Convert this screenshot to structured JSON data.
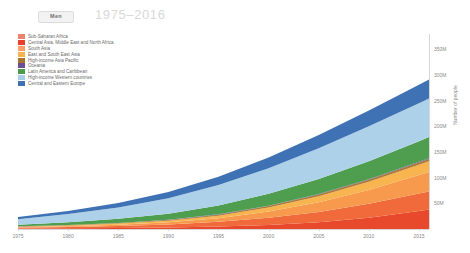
{
  "header": {
    "toggle_label": "Men",
    "title": "1975–2016"
  },
  "axes": {
    "y_title": "Number of people",
    "y_ticks": [
      "50M",
      "100M",
      "150M",
      "200M",
      "250M",
      "300M",
      "350M"
    ],
    "x_ticks": [
      "1975",
      "1980",
      "1985",
      "1990",
      "1995",
      "2000",
      "2005",
      "2010",
      "2015"
    ]
  },
  "legend": {
    "items": [
      {
        "label": "Sub-Saharan Africa",
        "color": "#f0826a"
      },
      {
        "label": "Central Asia, Middle East and North Africa",
        "color": "#e8402a"
      },
      {
        "label": "South Asia",
        "color": "#f9a06a"
      },
      {
        "label": "East and South East Asia",
        "color": "#f6b352"
      },
      {
        "label": "High-income Asia Pacific",
        "color": "#a9732e"
      },
      {
        "label": "Oceania",
        "color": "#6a4f93"
      },
      {
        "label": "Latin America and Caribbean",
        "color": "#4c9a4c"
      },
      {
        "label": "High-income Western countries",
        "color": "#a9cde8"
      },
      {
        "label": "Central and Eastern Europe",
        "color": "#3f72b5"
      }
    ]
  },
  "chart_data": {
    "type": "area",
    "stacked": true,
    "title": "1975–2016",
    "xlabel": "",
    "ylabel": "Number of people",
    "xlim": [
      1975,
      2016
    ],
    "ylim": [
      0,
      380
    ],
    "y_unit": "millions",
    "grid": false,
    "legend_position": "top-left",
    "x": [
      1975,
      1980,
      1985,
      1990,
      1995,
      2000,
      2005,
      2010,
      2015,
      2016
    ],
    "series": [
      {
        "name": "Sub-Saharan Africa",
        "color": "#e8492c",
        "values": [
          1,
          1.5,
          2,
          3,
          5,
          8,
          13,
          22,
          35,
          38
        ]
      },
      {
        "name": "Central Asia, Middle East and North Africa",
        "color": "#f06a3c",
        "values": [
          1.5,
          2.5,
          4,
          6,
          9,
          14,
          20,
          27,
          34,
          35
        ]
      },
      {
        "name": "South Asia",
        "color": "#f79a4e",
        "values": [
          1,
          1.5,
          2.5,
          4,
          7,
          12,
          19,
          27,
          36,
          38
        ]
      },
      {
        "name": "East and South East Asia",
        "color": "#f8b44f",
        "values": [
          1,
          1.5,
          2,
          3,
          5,
          8,
          12,
          16,
          20,
          21
        ]
      },
      {
        "name": "High-income Asia Pacific",
        "color": "#b07a33",
        "values": [
          0.5,
          0.7,
          1,
          1.4,
          2,
          2.6,
          3.2,
          3.8,
          4.4,
          4.5
        ]
      },
      {
        "name": "Oceania",
        "color": "#6a4f93",
        "values": [
          0.2,
          0.3,
          0.4,
          0.5,
          0.7,
          0.9,
          1.1,
          1.3,
          1.5,
          1.6
        ]
      },
      {
        "name": "Latin America and Caribbean",
        "color": "#4f9e4f",
        "values": [
          3,
          5,
          8,
          12,
          17,
          23,
          29,
          35,
          40,
          41
        ]
      },
      {
        "name": "High-income Western countries",
        "color": "#aed1ea",
        "values": [
          11,
          16,
          22,
          30,
          40,
          50,
          60,
          68,
          74,
          75
        ]
      },
      {
        "name": "Central and Eastern Europe",
        "color": "#3f72b5",
        "values": [
          4,
          6,
          9,
          12,
          16,
          21,
          26,
          31,
          36,
          37
        ]
      }
    ],
    "totals": [
      23.2,
      35,
      52.9,
      71.9,
      101.7,
      139.5,
      183.3,
      231.1,
      280.9,
      291.1
    ]
  }
}
